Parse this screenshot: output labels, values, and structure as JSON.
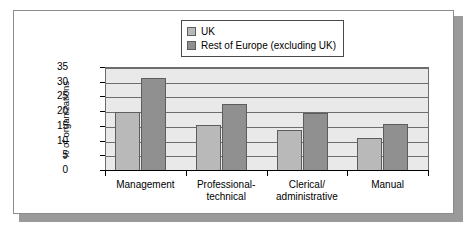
{
  "chart_data": {
    "type": "bar",
    "title": "",
    "subtitle": "",
    "xlabel": "",
    "ylabel": "% of organizations",
    "ylim": [
      0,
      35
    ],
    "yticks": [
      0,
      5,
      10,
      15,
      20,
      25,
      30,
      35
    ],
    "ytick_labels": [
      "0",
      "5",
      "10",
      "15",
      "20",
      "25",
      "30",
      "35"
    ],
    "grid": true,
    "legend_position": "top-center",
    "categories": [
      "Management",
      "Professional-technical",
      "Clerical/administrative",
      "Manual"
    ],
    "category_lines": [
      [
        "Management"
      ],
      [
        "Professional-",
        "technical"
      ],
      [
        "Clerical/",
        "administrative"
      ],
      [
        "Manual"
      ]
    ],
    "series": [
      {
        "name": "UK",
        "color": "#b9b9b9",
        "values": [
          20.0,
          15.7,
          14.0,
          11.3
        ]
      },
      {
        "name": "Rest of Europe (excluding UK)",
        "color": "#909090",
        "values": [
          31.5,
          22.8,
          19.7,
          16.1
        ]
      }
    ]
  },
  "legend": {
    "items": [
      {
        "label": "UK",
        "color": "#b9b9b9"
      },
      {
        "label": "Rest of Europe (excluding UK)",
        "color": "#909090"
      }
    ]
  },
  "colors": {
    "series_uk": "#b9b9b9",
    "series_europe": "#909090",
    "plot_background": "#e9e9e9",
    "gridline": "#6d6d6d",
    "axis": "#000000",
    "panel_background": "#ffffff",
    "panel_border": "#8c8c8c",
    "panel_shadow": "#9a9a9a"
  }
}
